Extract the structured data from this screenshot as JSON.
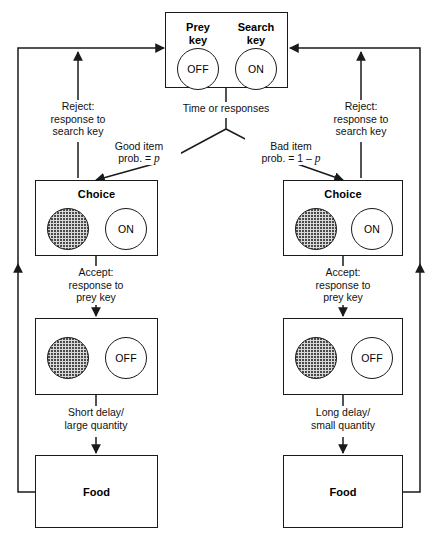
{
  "diagram": {
    "stroke_color": "#1a1a1a",
    "hatch_color": "#d9d9d9",
    "background": "#ffffff"
  },
  "search_box": {
    "name": "search-state-box",
    "prey_key": {
      "label_line1": "Prey",
      "label_line2": "key",
      "state": "OFF"
    },
    "search_key": {
      "label_line1": "Search",
      "label_line2": "key",
      "state": "ON"
    }
  },
  "transitions": {
    "time_or_responses": "Time or responses",
    "good_item_line1": "Good item",
    "good_item_line2_pre": "prob. = ",
    "good_item_line2_var": "p",
    "bad_item_line1": "Bad item",
    "bad_item_line2_pre": "prob. = 1 – ",
    "bad_item_line2_var": "p",
    "reject_left": "Reject:\nresponse to\nsearch key",
    "reject_right": "Reject:\nresponse to\nsearch key",
    "accept_left": "Accept:\nresponse to\nprey key",
    "accept_right": "Accept:\nresponse to\nprey key",
    "outcome_left": "Short delay/\nlarge quantity",
    "outcome_right": "Long delay/\nsmall quantity"
  },
  "left_branch": {
    "choice_box": {
      "title": "Choice",
      "prey_circle": "hatched",
      "search_circle_state": "ON"
    },
    "handling_box": {
      "title": "",
      "prey_circle": "hatched",
      "search_circle_state": "OFF"
    },
    "food_box": {
      "label": "Food"
    }
  },
  "right_branch": {
    "choice_box": {
      "title": "Choice",
      "prey_circle": "hatched",
      "search_circle_state": "ON"
    },
    "handling_box": {
      "title": "",
      "prey_circle": "hatched",
      "search_circle_state": "OFF"
    },
    "food_box": {
      "label": "Food"
    }
  }
}
